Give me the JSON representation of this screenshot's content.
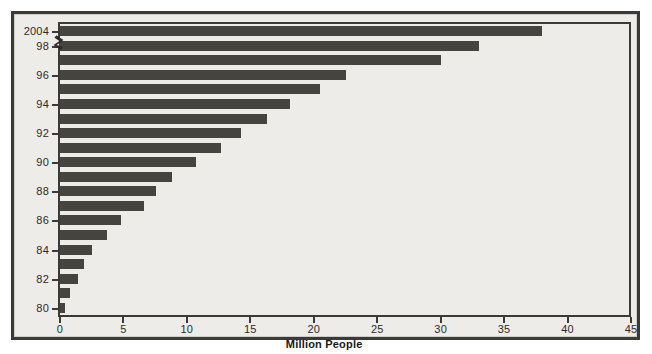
{
  "chart_data": {
    "type": "bar",
    "orientation": "horizontal",
    "title": "",
    "xlabel": "Million People",
    "ylabel": "",
    "xlim": [
      0,
      45
    ],
    "xticks": [
      0,
      5,
      10,
      15,
      20,
      25,
      30,
      35,
      40,
      45
    ],
    "xtick_labels": [
      "0",
      "5",
      "10",
      "15",
      "20",
      "25",
      "30",
      "35",
      "40",
      "45"
    ],
    "ytick_labels": [
      "2004",
      "98",
      "96",
      "94",
      "92",
      "90",
      "88",
      "86",
      "84",
      "82",
      "80"
    ],
    "y_axis_break": true,
    "y_axis_break_between": [
      "2004",
      "98"
    ],
    "grid": false,
    "legend": false,
    "bar_color": "#46443f",
    "plot_background": "#eeece8",
    "frame_color": "#3a3a38",
    "categories": [
      "2004",
      "98",
      "97",
      "96",
      "95",
      "94",
      "93",
      "92",
      "91",
      "90",
      "89",
      "88",
      "87",
      "86",
      "85",
      "84",
      "83",
      "82",
      "81",
      "80"
    ],
    "values": [
      38.0,
      33.0,
      30.0,
      22.5,
      20.5,
      18.1,
      16.3,
      14.3,
      12.7,
      10.7,
      8.8,
      7.6,
      6.6,
      4.8,
      3.7,
      2.5,
      1.9,
      1.4,
      0.8,
      0.4
    ],
    "labelled_ticks": [
      {
        "label": "2004",
        "index": 0
      },
      {
        "label": "98",
        "index": 1
      },
      {
        "label": "96",
        "index": 3
      },
      {
        "label": "94",
        "index": 5
      },
      {
        "label": "92",
        "index": 7
      },
      {
        "label": "90",
        "index": 9
      },
      {
        "label": "88",
        "index": 11
      },
      {
        "label": "86",
        "index": 13
      },
      {
        "label": "84",
        "index": 15
      },
      {
        "label": "82",
        "index": 17
      },
      {
        "label": "80",
        "index": 19
      }
    ]
  }
}
